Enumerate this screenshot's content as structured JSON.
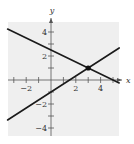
{
  "chart_data": {
    "type": "line",
    "title": "",
    "xlabel": "x",
    "ylabel": "y",
    "xlim": [
      -3.5,
      5.5
    ],
    "ylim": [
      -4.5,
      4.5
    ],
    "x_ticks": [
      -3,
      -2,
      -1,
      1,
      2,
      3,
      4,
      5
    ],
    "y_ticks": [
      -4,
      -3,
      -2,
      -1,
      1,
      2,
      3,
      4
    ],
    "x_tick_labels": [
      "-2",
      "2",
      "4"
    ],
    "x_tick_label_values": [
      -2,
      2,
      4
    ],
    "y_tick_labels": [
      "4",
      "2",
      "-2",
      "-4"
    ],
    "y_tick_label_values": [
      4,
      2,
      -2,
      -4
    ],
    "grid": false,
    "background": "#efefef",
    "series": [
      {
        "name": "line-decreasing",
        "equation": "y = -0.5x + 2.5",
        "x": [
          -3.5,
          5.5
        ],
        "y": [
          4.25,
          -0.25
        ],
        "color": "#1a1a1a"
      },
      {
        "name": "line-increasing",
        "equation": "y = (2/3)x - 1",
        "x": [
          -3.5,
          5.5
        ],
        "y": [
          -3.33,
          2.67
        ],
        "color": "#1a1a1a"
      }
    ],
    "points": [
      {
        "name": "intersection",
        "x": 3,
        "y": 1
      }
    ]
  }
}
